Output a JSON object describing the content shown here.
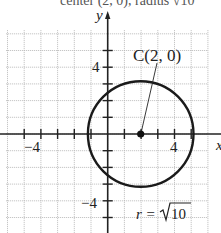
{
  "top_caption": "center (2, 0), radius √10",
  "axes": {
    "x_label": "x",
    "y_label": "y",
    "unit": 1,
    "x_range": [
      -6,
      6
    ],
    "y_range": [
      -6,
      6
    ],
    "tick_labels": {
      "x_neg": "−4",
      "x_pos": "4",
      "y_pos": "4",
      "y_neg": "−4"
    }
  },
  "circle": {
    "center_label": "C(2, 0)",
    "center": [
      2,
      0
    ],
    "radius_label": "r = √10",
    "radius_text_prefix": "r =",
    "radius_sqrt_arg": "10",
    "radius": 3.1623
  },
  "colors": {
    "grid": "#b8b8b8",
    "axis": "#222222",
    "circle": "#1a1a1a",
    "background": "#ffffff"
  }
}
